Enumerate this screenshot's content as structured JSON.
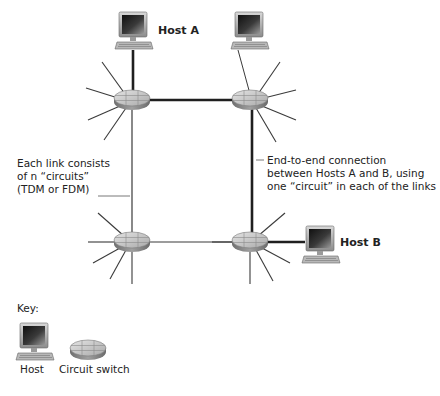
{
  "labels": {
    "host_a": "Host A",
    "host_b": "Host B",
    "link_note": [
      "Each link consists",
      "of n “circuits”",
      "(TDM or FDM)"
    ],
    "connection_note": [
      "End-to-end connection",
      "between Hosts A and B, using",
      "one “circuit” in each of the links"
    ]
  },
  "key": {
    "title": "Key:",
    "items": [
      {
        "icon": "host-icon",
        "label": "Host"
      },
      {
        "icon": "circuit-switch-icon",
        "label": "Circuit switch"
      }
    ]
  },
  "nodes": {
    "switches": [
      {
        "id": "sw-top-left",
        "x": 132,
        "y": 100
      },
      {
        "id": "sw-top-right",
        "x": 250,
        "y": 100
      },
      {
        "id": "sw-bottom-left",
        "x": 132,
        "y": 242
      },
      {
        "id": "sw-bottom-right",
        "x": 250,
        "y": 242
      }
    ],
    "hosts": [
      {
        "id": "host-a",
        "x": 100,
        "y": 12
      },
      {
        "id": "host-top-right",
        "x": 220,
        "y": 12
      },
      {
        "id": "host-b",
        "x": 302,
        "y": 226
      }
    ]
  },
  "colors": {
    "line": "#3a3a3a",
    "path": "#1f1f1f",
    "switch_top": "#c9c9c9",
    "switch_side": "#8a8a8a"
  }
}
